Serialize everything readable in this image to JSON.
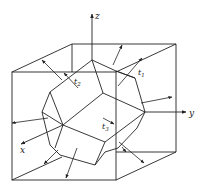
{
  "diagram": {
    "colors": {
      "stroke": "#222222",
      "background": "#ffffff"
    },
    "axes": {
      "x": {
        "label": "x"
      },
      "y": {
        "label": "y"
      },
      "z": {
        "label": "z"
      }
    },
    "vectors": {
      "t1": {
        "label": "t",
        "sub": "1"
      },
      "t2": {
        "label": "t",
        "sub": "2"
      },
      "t3": {
        "label": "t",
        "sub": "3"
      }
    }
  }
}
